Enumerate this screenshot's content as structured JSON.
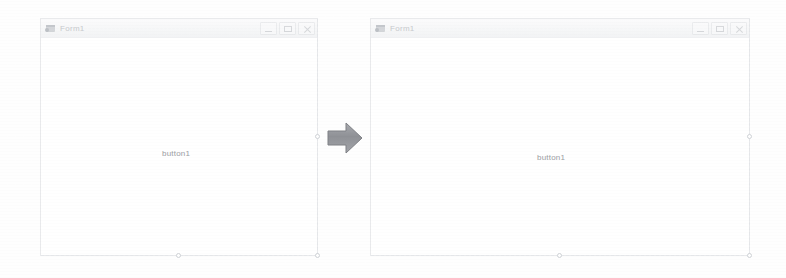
{
  "scene": {
    "description": "before-after-form-designer",
    "background_color": "#fefefe",
    "arrow_color": "#8f9196"
  },
  "windows": [
    {
      "id": "before",
      "title": "Form1",
      "icon": "form-app-icon",
      "controls": [
        {
          "name": "minimize",
          "glyph": "–"
        },
        {
          "name": "maximize",
          "glyph": "□"
        },
        {
          "name": "close",
          "glyph": "✕"
        }
      ],
      "button": {
        "label": "button1"
      },
      "handles": [
        "mid-right",
        "bottom-mid",
        "bottom-right"
      ]
    },
    {
      "id": "after",
      "title": "Form1",
      "icon": "form-app-icon",
      "controls": [
        {
          "name": "minimize",
          "glyph": "–"
        },
        {
          "name": "maximize",
          "glyph": "□"
        },
        {
          "name": "close",
          "glyph": "✕"
        }
      ],
      "button": {
        "label": "button1"
      },
      "handles": [
        "mid-right",
        "bottom-mid",
        "bottom-right"
      ]
    }
  ],
  "arrow": {
    "name": "transition-arrow",
    "direction": "right"
  }
}
